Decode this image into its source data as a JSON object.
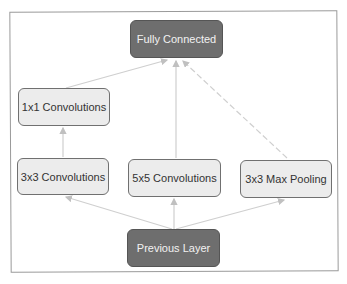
{
  "diagram": {
    "type": "inception-module",
    "colors": {
      "dark_node": "#6e6e6e",
      "light_node": "#ececec",
      "edge": "#c8c8c8",
      "frame": "#9a9a9a"
    },
    "nodes": [
      {
        "id": "fully_connected",
        "label": "Fully Connected",
        "style": "dark"
      },
      {
        "id": "conv1x1",
        "label": "1x1 Convolutions",
        "style": "light"
      },
      {
        "id": "conv3x3",
        "label": "3x3 Convolutions",
        "style": "light"
      },
      {
        "id": "conv5x5",
        "label": "5x5 Convolutions",
        "style": "light"
      },
      {
        "id": "maxpool3x3",
        "label": "3x3 Max Pooling",
        "style": "light"
      },
      {
        "id": "previous_layer",
        "label": "Previous Layer",
        "style": "dark"
      }
    ],
    "edges": [
      {
        "from": "previous_layer",
        "to": "conv3x3"
      },
      {
        "from": "previous_layer",
        "to": "conv5x5"
      },
      {
        "from": "previous_layer",
        "to": "maxpool3x3"
      },
      {
        "from": "conv3x3",
        "to": "conv1x1"
      },
      {
        "from": "conv1x1",
        "to": "fully_connected"
      },
      {
        "from": "conv5x5",
        "to": "fully_connected"
      },
      {
        "from": "maxpool3x3",
        "to": "fully_connected"
      }
    ]
  }
}
